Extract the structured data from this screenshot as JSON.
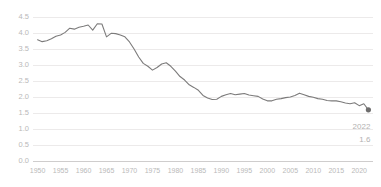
{
  "chart_data": {
    "type": "line",
    "title": "",
    "subtitle": "",
    "xlabel": "",
    "ylabel": "",
    "xlim": [
      1949,
      2023
    ],
    "ylim": [
      0.0,
      4.65
    ],
    "grid": true,
    "legend": false,
    "line_color": "#7c7b7b",
    "grid_color": "#eceaea",
    "label_color": "#b9b9b9",
    "y_ticks": [
      "0.0",
      "0.5",
      "1.0",
      "1.5",
      "2.0",
      "2.5",
      "3.0",
      "3.5",
      "4.0",
      "4.5"
    ],
    "y_tick_values": [
      0.0,
      0.5,
      1.0,
      1.5,
      2.0,
      2.5,
      3.0,
      3.5,
      4.0,
      4.5
    ],
    "x_ticks": [
      "1950",
      "1955",
      "1960",
      "1965",
      "1970",
      "1975",
      "1980",
      "1985",
      "1990",
      "1995",
      "2000",
      "2005",
      "2010",
      "2015",
      "2020"
    ],
    "x_tick_values": [
      1950,
      1955,
      1960,
      1965,
      1970,
      1975,
      1980,
      1985,
      1990,
      1995,
      2000,
      2005,
      2010,
      2015,
      2020
    ],
    "x": [
      1950,
      1951,
      1952,
      1953,
      1954,
      1955,
      1956,
      1957,
      1958,
      1959,
      1960,
      1961,
      1962,
      1963,
      1964,
      1965,
      1966,
      1967,
      1968,
      1969,
      1970,
      1971,
      1972,
      1973,
      1974,
      1975,
      1976,
      1977,
      1978,
      1979,
      1980,
      1981,
      1982,
      1983,
      1984,
      1985,
      1986,
      1987,
      1988,
      1989,
      1990,
      1991,
      1992,
      1993,
      1994,
      1995,
      1996,
      1997,
      1998,
      1999,
      2000,
      2001,
      2002,
      2003,
      2004,
      2005,
      2006,
      2007,
      2008,
      2009,
      2010,
      2011,
      2012,
      2013,
      2014,
      2015,
      2016,
      2017,
      2018,
      2019,
      2020,
      2021,
      2022
    ],
    "values": [
      3.79,
      3.73,
      3.76,
      3.82,
      3.9,
      3.94,
      4.02,
      4.15,
      4.12,
      4.18,
      4.21,
      4.25,
      4.09,
      4.29,
      4.28,
      3.88,
      3.99,
      3.98,
      3.94,
      3.88,
      3.72,
      3.5,
      3.25,
      3.05,
      2.96,
      2.84,
      2.92,
      3.03,
      3.07,
      2.96,
      2.81,
      2.64,
      2.53,
      2.38,
      2.3,
      2.21,
      2.05,
      1.97,
      1.92,
      1.93,
      2.02,
      2.07,
      2.11,
      2.07,
      2.09,
      2.11,
      2.06,
      2.04,
      2.02,
      1.94,
      1.88,
      1.88,
      1.93,
      1.95,
      1.98,
      2.0,
      2.05,
      2.12,
      2.07,
      2.02,
      1.99,
      1.95,
      1.93,
      1.89,
      1.88,
      1.88,
      1.85,
      1.81,
      1.79,
      1.82,
      1.73,
      1.79,
      1.6
    ],
    "annotation": {
      "year": "2022",
      "value": "1.6",
      "point_x": 2022,
      "point_y": 1.6,
      "marker": "dot"
    }
  }
}
